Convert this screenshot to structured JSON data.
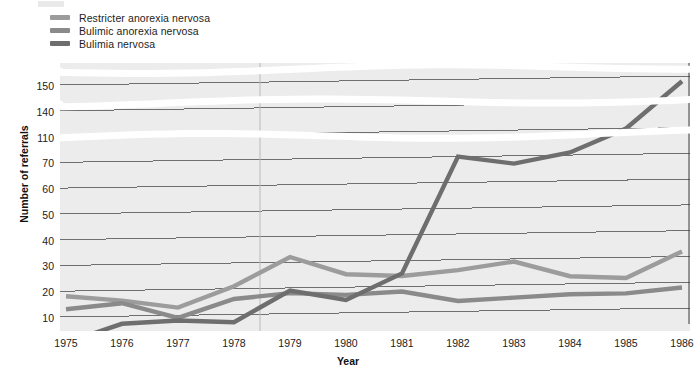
{
  "legend": {
    "position": "top-left",
    "items": [
      {
        "label": "Restricter anorexia nervosa",
        "color": "#9c9c9c",
        "key": "restricter"
      },
      {
        "label": "Bulimic anorexia nervosa",
        "color": "#8a8a8a",
        "key": "bulimic"
      },
      {
        "label": "Bulimia nervosa",
        "color": "#6e6e6e",
        "key": "bulimia"
      }
    ]
  },
  "axes": {
    "ylabel": "Number of referrals",
    "xlabel": "Year",
    "ytick_labels": [
      "10",
      "20",
      "30",
      "40",
      "50",
      "60",
      "70",
      "110",
      "140",
      "150"
    ],
    "xtick_labels": [
      "1975",
      "1976",
      "1977",
      "1978",
      "1979",
      "1980",
      "1981",
      "1982",
      "1983",
      "1984",
      "1985",
      "1986"
    ]
  },
  "caption": "",
  "chart_data": {
    "type": "line",
    "title": "",
    "xlabel": "Year",
    "ylabel": "Number of referrals",
    "grid": true,
    "legend_position": "top-left",
    "x": [
      1975,
      1976,
      1977,
      1978,
      1979,
      1980,
      1981,
      1982,
      1983,
      1984,
      1985,
      1986
    ],
    "categories": [
      "1975",
      "1976",
      "1977",
      "1978",
      "1979",
      "1980",
      "1981",
      "1982",
      "1983",
      "1984",
      "1985",
      "1986"
    ],
    "y_axis_ticks": [
      10,
      20,
      30,
      40,
      50,
      60,
      70,
      110,
      140,
      150
    ],
    "y_axis_note": "Non-linear (compressed) scale above 70: ticks 10-70 in steps of 10, then 110, 140, 150 at equal pixel spacing",
    "ylim": [
      0,
      155
    ],
    "series": [
      {
        "name": "Restricter anorexia nervosa",
        "color": "#9c9c9c",
        "values": [
          18,
          16,
          13,
          21,
          32,
          25,
          24,
          26,
          29,
          23,
          22,
          32
        ]
      },
      {
        "name": "Bulimic anorexia nervosa",
        "color": "#8a8a8a",
        "values": [
          13,
          15,
          9,
          16,
          18,
          17,
          18,
          14,
          15,
          16,
          16,
          18
        ]
      },
      {
        "name": "Bulimia nervosa",
        "color": "#6e6e6e",
        "values": [
          0,
          7,
          8,
          7,
          19,
          15,
          25,
          70,
          67,
          74,
          110,
          148
        ]
      }
    ]
  }
}
